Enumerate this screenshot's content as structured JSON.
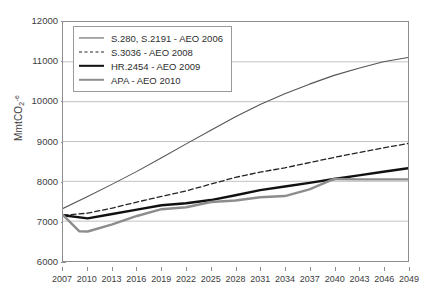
{
  "chart_data": {
    "type": "line",
    "title": "",
    "xlabel": "",
    "ylabel": "MmtCO2-e",
    "ylabel_parts": {
      "prefix": "MmtCO",
      "sub": "2",
      "sup": "-e"
    },
    "xlim": [
      2007,
      2049
    ],
    "ylim": [
      6000,
      12000
    ],
    "yticks": [
      6000,
      7000,
      8000,
      9000,
      10000,
      11000,
      12000
    ],
    "ytick_labels": [
      "6000",
      "7000",
      "8000",
      "9000",
      "10000",
      "11000",
      "12000"
    ],
    "xticks": [
      2007,
      2010,
      2013,
      2016,
      2019,
      2022,
      2025,
      2028,
      2031,
      2034,
      2037,
      2040,
      2043,
      2046,
      2049
    ],
    "xtick_labels": [
      "2007",
      "2010",
      "2013",
      "2016",
      "2019",
      "2022",
      "2025",
      "2028",
      "2031",
      "2034",
      "2037",
      "2040",
      "2043",
      "2046",
      "2049"
    ],
    "grid": "horizontal",
    "legend_position": "top-left",
    "series": [
      {
        "name": "S.280, S.2191 - AEO 2006",
        "style": "solid-thin",
        "color": "#555555",
        "width": 1.1,
        "x": [
          2007,
          2010,
          2013,
          2016,
          2019,
          2022,
          2025,
          2028,
          2031,
          2034,
          2037,
          2040,
          2043,
          2046,
          2049
        ],
        "values": [
          7320,
          7620,
          7930,
          8250,
          8590,
          8940,
          9280,
          9620,
          9930,
          10200,
          10440,
          10660,
          10840,
          11000,
          11110
        ]
      },
      {
        "name": "S.3036 - AEO 2008",
        "style": "dashed",
        "color": "#242424",
        "width": 1.3,
        "x": [
          2007,
          2010,
          2013,
          2016,
          2019,
          2022,
          2025,
          2028,
          2031,
          2034,
          2037,
          2040,
          2043,
          2046,
          2049
        ],
        "values": [
          7150,
          7200,
          7330,
          7480,
          7620,
          7760,
          7930,
          8100,
          8230,
          8340,
          8470,
          8600,
          8720,
          8840,
          8950
        ]
      },
      {
        "name": "HR.2454 - AEO 2009",
        "style": "solid-thick",
        "color": "#111111",
        "width": 2.4,
        "x": [
          2007,
          2010,
          2013,
          2016,
          2019,
          2022,
          2025,
          2028,
          2031,
          2034,
          2037,
          2040,
          2043,
          2046,
          2049
        ],
        "values": [
          7150,
          7070,
          7180,
          7290,
          7400,
          7450,
          7530,
          7650,
          7780,
          7870,
          7960,
          8060,
          8150,
          8240,
          8330
        ]
      },
      {
        "name": "APA - AEO 2010",
        "style": "solid-gray",
        "color": "#8d8d8d",
        "width": 2.4,
        "x": [
          2007,
          2009,
          2010,
          2013,
          2016,
          2019,
          2022,
          2025,
          2028,
          2031,
          2034,
          2037,
          2040,
          2043,
          2046,
          2049
        ],
        "values": [
          7150,
          6745,
          6740,
          6920,
          7130,
          7300,
          7350,
          7480,
          7520,
          7600,
          7630,
          7800,
          8060,
          8050,
          8050,
          8050
        ]
      }
    ]
  },
  "legend": {
    "items": [
      {
        "label": "S.280, S.2191 - AEO 2006"
      },
      {
        "label": "S.3036 - AEO 2008"
      },
      {
        "label": "HR.2454 - AEO 2009"
      },
      {
        "label": "APA - AEO 2010"
      }
    ]
  }
}
